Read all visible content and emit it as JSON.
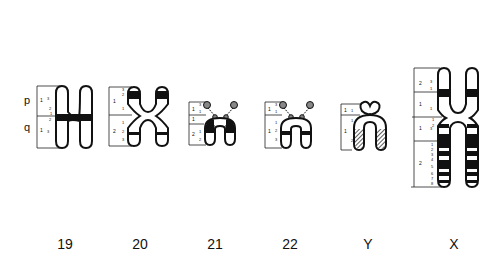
{
  "figure": {
    "type": "chromosome ideogram (banding pattern)",
    "arm_labels": {
      "p": "p",
      "q": "q"
    },
    "colors": {
      "outline": "#111111",
      "band": "#111111",
      "background": "#ffffff",
      "hatched": "#666666"
    }
  },
  "chromosomes": [
    {
      "name": "19",
      "x_label": 65,
      "p_regions": [
        {
          "region": "1",
          "bands": [
            "3",
            "2",
            "1"
          ]
        }
      ],
      "q_regions": [
        {
          "region": "1",
          "bands": [
            "1",
            "2",
            "3"
          ]
        }
      ],
      "dark_bands": [
        "centromeric (p1.1 / q1.1)"
      ]
    },
    {
      "name": "20",
      "x_label": 140,
      "p_regions": [
        {
          "region": "1",
          "bands": [
            "3",
            "2",
            "1"
          ]
        }
      ],
      "q_regions": [
        {
          "region": "2"
        },
        {
          "region": "1",
          "bands": [
            "1",
            "2",
            "3"
          ]
        }
      ],
      "dark_bands": [
        "p1.2",
        "q1.2"
      ]
    },
    {
      "name": "21",
      "x_label": 215,
      "p_regions": [
        {
          "region": "1",
          "bands": [
            "3",
            "2",
            "1"
          ]
        }
      ],
      "q_regions": [
        {
          "region": "1"
        },
        {
          "region": "2",
          "bands": [
            "1",
            "2"
          ]
        }
      ],
      "dark_bands": [
        "q2.1"
      ],
      "satellites": true
    },
    {
      "name": "22",
      "x_label": 290,
      "p_regions": [
        {
          "region": "1",
          "bands": [
            "3",
            "2",
            "1"
          ]
        }
      ],
      "q_regions": [
        {
          "region": "1",
          "bands": [
            "1",
            "2",
            "3"
          ]
        }
      ],
      "dark_bands": [
        "q1.2"
      ],
      "satellites": true
    },
    {
      "name": "Y",
      "x_label": 365,
      "p_regions": [
        {
          "region": "1",
          "bands": [
            "1"
          ]
        }
      ],
      "q_regions": [
        {
          "region": "1",
          "bands": [
            "1",
            "2"
          ]
        }
      ],
      "dark_bands": [
        "q1.2 (heterochromatic, hatched)"
      ]
    },
    {
      "name": "X",
      "x_label": 448,
      "p_regions": [
        {
          "region": "2",
          "bands": [
            "3",
            "2",
            "1"
          ]
        },
        {
          "region": "1",
          "bands": [
            "1"
          ]
        }
      ],
      "q_regions": [
        {
          "region": "1",
          "bands": [
            "1",
            "2",
            "3"
          ]
        },
        {
          "region": "2",
          "bands": [
            "1",
            "2",
            "3",
            "4",
            "5",
            "6",
            "7",
            "8"
          ]
        }
      ],
      "dark_bands": [
        "p2.1",
        "q1.3",
        "q2.2",
        "q2.4",
        "q2.6",
        "q2.8"
      ]
    }
  ],
  "labels": [
    "19",
    "20",
    "21",
    "22",
    "Y",
    "X"
  ]
}
